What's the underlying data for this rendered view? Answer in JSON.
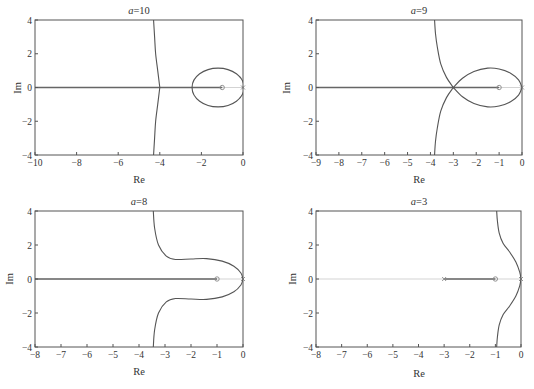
{
  "figure": {
    "caption": "",
    "colors": {
      "frame": "#555555",
      "locus": "#555555",
      "real_axis": "#c8c8c8",
      "marker": "#888888",
      "text": "#333333"
    }
  },
  "chart_data": [
    {
      "type": "line",
      "subtype": "root-locus",
      "title_var": "a",
      "title_val": "=10",
      "title": "a=10",
      "xlabel": "Re",
      "ylabel": "Im",
      "xlim": [
        -10,
        0
      ],
      "ylim": [
        -4,
        4
      ],
      "xticks": [
        -10,
        -8,
        -6,
        -4,
        -2,
        0
      ],
      "yticks": [
        -4,
        -2,
        0,
        2,
        4
      ],
      "grid": false,
      "frame": {
        "x": 35,
        "y": 20,
        "w": 208,
        "h": 135
      },
      "markers": [
        {
          "re": -1,
          "im": 0,
          "kind": "zero-o"
        },
        {
          "re": 0,
          "im": 0,
          "kind": "pole-x"
        }
      ],
      "real_axis_segments": [
        [
          -10,
          -1
        ]
      ],
      "branches": [
        {
          "name": "asymptote-branch-upper",
          "points": [
            [
              -4.0,
              0
            ],
            [
              -4.1,
              1
            ],
            [
              -4.2,
              2
            ],
            [
              -4.25,
              3
            ],
            [
              -4.3,
              4
            ]
          ]
        },
        {
          "name": "asymptote-branch-lower",
          "points": [
            [
              -4.0,
              0
            ],
            [
              -4.1,
              -1
            ],
            [
              -4.2,
              -2
            ],
            [
              -4.25,
              -3
            ],
            [
              -4.3,
              -4
            ]
          ]
        },
        {
          "name": "loop",
          "ellipse": {
            "cx": -1.2,
            "cy": 0,
            "rx": 1.25,
            "ry": 1.15
          }
        }
      ]
    },
    {
      "type": "line",
      "subtype": "root-locus",
      "title_var": "a",
      "title_val": "=9",
      "title": "a=9",
      "xlabel": "Re",
      "ylabel": "Im",
      "xlim": [
        -9,
        0
      ],
      "ylim": [
        -4,
        4
      ],
      "xticks": [
        -9,
        -8,
        -7,
        -6,
        -5,
        -4,
        -3,
        -2,
        -1,
        0
      ],
      "yticks": [
        -4,
        -2,
        0,
        2,
        4
      ],
      "grid": false,
      "frame": {
        "x": 316,
        "y": 20,
        "w": 206,
        "h": 135
      },
      "markers": [
        {
          "re": -1,
          "im": 0,
          "kind": "zero-o"
        },
        {
          "re": 0,
          "im": 0,
          "kind": "pole-x"
        }
      ],
      "real_axis_segments": [
        [
          -9,
          -1
        ]
      ],
      "branches": [
        {
          "name": "upper-outer",
          "points": [
            [
              -3.0,
              0
            ],
            [
              -3.3,
              0.6
            ],
            [
              -3.55,
              1.4
            ],
            [
              -3.7,
              2.4
            ],
            [
              -3.78,
              3.2
            ],
            [
              -3.82,
              4
            ]
          ]
        },
        {
          "name": "lower-outer",
          "points": [
            [
              -3.0,
              0
            ],
            [
              -3.3,
              -0.6
            ],
            [
              -3.55,
              -1.4
            ],
            [
              -3.7,
              -2.4
            ],
            [
              -3.78,
              -3.2
            ],
            [
              -3.82,
              -4
            ]
          ]
        },
        {
          "name": "upper-loop",
          "points": [
            [
              -3.0,
              0
            ],
            [
              -2.6,
              0.55
            ],
            [
              -2.1,
              0.95
            ],
            [
              -1.5,
              1.15
            ],
            [
              -1.0,
              1.1
            ],
            [
              -0.5,
              0.85
            ],
            [
              -0.15,
              0.45
            ],
            [
              0,
              0
            ]
          ]
        },
        {
          "name": "lower-loop",
          "points": [
            [
              -3.0,
              0
            ],
            [
              -2.6,
              -0.55
            ],
            [
              -2.1,
              -0.95
            ],
            [
              -1.5,
              -1.15
            ],
            [
              -1.0,
              -1.1
            ],
            [
              -0.5,
              -0.85
            ],
            [
              -0.15,
              -0.45
            ],
            [
              0,
              0
            ]
          ]
        }
      ]
    },
    {
      "type": "line",
      "subtype": "root-locus",
      "title_var": "a",
      "title_val": "=8",
      "title": "a=8",
      "xlabel": "Re",
      "ylabel": "Im",
      "xlim": [
        -8,
        0
      ],
      "ylim": [
        -4,
        4
      ],
      "xticks": [
        -8,
        -7,
        -6,
        -5,
        -4,
        -3,
        -2,
        -1,
        0
      ],
      "yticks": [
        -4,
        -2,
        0,
        2,
        4
      ],
      "grid": false,
      "frame": {
        "x": 35,
        "y": 211,
        "w": 208,
        "h": 136
      },
      "markers": [
        {
          "re": -1,
          "im": 0,
          "kind": "zero-o"
        },
        {
          "re": 0,
          "im": 0,
          "kind": "pole-x"
        }
      ],
      "real_axis_segments": [
        [
          -8,
          -1
        ]
      ],
      "branches": [
        {
          "name": "upper",
          "points": [
            [
              -3.45,
              4
            ],
            [
              -3.4,
              3.0
            ],
            [
              -3.25,
              2.0
            ],
            [
              -2.95,
              1.35
            ],
            [
              -2.6,
              1.15
            ],
            [
              -2.0,
              1.18
            ],
            [
              -1.4,
              1.2
            ],
            [
              -0.8,
              1.05
            ],
            [
              -0.35,
              0.75
            ],
            [
              -0.08,
              0.35
            ],
            [
              0,
              0
            ]
          ]
        },
        {
          "name": "lower",
          "points": [
            [
              -3.45,
              -4
            ],
            [
              -3.4,
              -3.0
            ],
            [
              -3.25,
              -2.0
            ],
            [
              -2.95,
              -1.35
            ],
            [
              -2.6,
              -1.15
            ],
            [
              -2.0,
              -1.18
            ],
            [
              -1.4,
              -1.2
            ],
            [
              -0.8,
              -1.05
            ],
            [
              -0.35,
              -0.75
            ],
            [
              -0.08,
              -0.35
            ],
            [
              0,
              0
            ]
          ]
        }
      ]
    },
    {
      "type": "line",
      "subtype": "root-locus",
      "title_var": "a",
      "title_val": "=3",
      "title": "a=3",
      "xlabel": "Re",
      "ylabel": "Im",
      "xlim": [
        -8,
        0
      ],
      "ylim": [
        -4,
        4
      ],
      "xticks": [
        -8,
        -7,
        -6,
        -5,
        -4,
        -3,
        -2,
        -1,
        0
      ],
      "yticks": [
        -4,
        -2,
        0,
        2,
        4
      ],
      "grid": false,
      "frame": {
        "x": 316,
        "y": 211,
        "w": 205,
        "h": 136
      },
      "markers": [
        {
          "re": -3,
          "im": 0,
          "kind": "pole-x"
        },
        {
          "re": -1,
          "im": 0,
          "kind": "zero-o"
        },
        {
          "re": 0,
          "im": 0,
          "kind": "pole-x"
        }
      ],
      "real_axis_segments": [
        [
          -3,
          -1
        ]
      ],
      "branches": [
        {
          "name": "upper",
          "points": [
            [
              0,
              0
            ],
            [
              -0.05,
              0.4
            ],
            [
              -0.2,
              1.0
            ],
            [
              -0.45,
              1.6
            ],
            [
              -0.7,
              2.1
            ],
            [
              -0.85,
              2.7
            ],
            [
              -0.92,
              3.4
            ],
            [
              -0.95,
              4
            ]
          ]
        },
        {
          "name": "lower",
          "points": [
            [
              0,
              0
            ],
            [
              -0.05,
              -0.4
            ],
            [
              -0.2,
              -1.0
            ],
            [
              -0.45,
              -1.6
            ],
            [
              -0.7,
              -2.1
            ],
            [
              -0.85,
              -2.7
            ],
            [
              -0.92,
              -3.4
            ],
            [
              -0.95,
              -4
            ]
          ]
        }
      ]
    }
  ]
}
